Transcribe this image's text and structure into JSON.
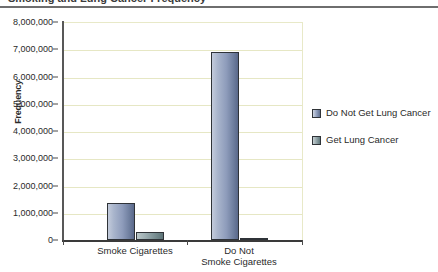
{
  "title": {
    "text": "Smoking and Lung Cancer Frequency",
    "visible_partial": true
  },
  "chart_data": {
    "type": "bar",
    "title": "",
    "xlabel": "",
    "ylabel": "Frequency",
    "ylim": [
      0,
      8000000
    ],
    "ytick_labels": [
      "0",
      "1,000,000",
      "2,000,000",
      "3,000,000",
      "4,000,000",
      "5,000,000",
      "6,000,000",
      "7,000,000",
      "8,000,000"
    ],
    "ytick_values": [
      0,
      1000000,
      2000000,
      3000000,
      4000000,
      5000000,
      6000000,
      7000000,
      8000000
    ],
    "grid": true,
    "legend_position": "right",
    "categories": [
      "Smoke Cigarettes",
      "Do Not Smoke Cigarettes"
    ],
    "category_lines": [
      [
        "Smoke Cigarettes"
      ],
      [
        "Do Not",
        "Smoke Cigarettes"
      ]
    ],
    "series": [
      {
        "name": "Do Not Get Lung Cancer",
        "values": [
          1350000,
          6900000
        ],
        "color": "#8e9cbb"
      },
      {
        "name": "Get Lung Cancer",
        "values": [
          300000,
          80000
        ],
        "color": "#8fa1a5"
      }
    ]
  },
  "legend": {
    "items": [
      {
        "label": "Do Not Get Lung Cancer"
      },
      {
        "label": "Get Lung Cancer"
      }
    ]
  },
  "colors": {
    "gridline": "#e6e7c4",
    "axis": "#3a3a3a",
    "bar_series_1": "#8e9cbb",
    "bar_series_2": "#8fa1a5",
    "bar_border": "#2f3338",
    "background": "#ffffff"
  }
}
